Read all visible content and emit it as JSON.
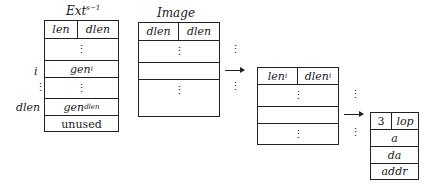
{
  "ext_table": {
    "title": "Ext",
    "title_sup": "s−1",
    "header": [
      "len",
      "dlen"
    ],
    "rows": [
      "⋮",
      "gen",
      "⋮",
      "gen",
      "unused"
    ],
    "row_subs": [
      "",
      "i",
      "",
      "dlen",
      ""
    ],
    "side_labels": [
      "i",
      "⋮",
      "dlen"
    ]
  },
  "image_table": {
    "title": "Image",
    "header": [
      "dlen",
      "dlen"
    ],
    "rows": [
      "⋮",
      "",
      "⋮"
    ]
  },
  "entry_table": {
    "header": [
      "len",
      "dlen"
    ],
    "header_subs": [
      "i",
      "i"
    ],
    "rows": [
      "⋮",
      "",
      "⋮"
    ]
  },
  "record_table": {
    "header": [
      "3",
      "lop"
    ],
    "rows": [
      "a",
      "da",
      "addr"
    ]
  },
  "connectors": {
    "dots": "⋮"
  }
}
